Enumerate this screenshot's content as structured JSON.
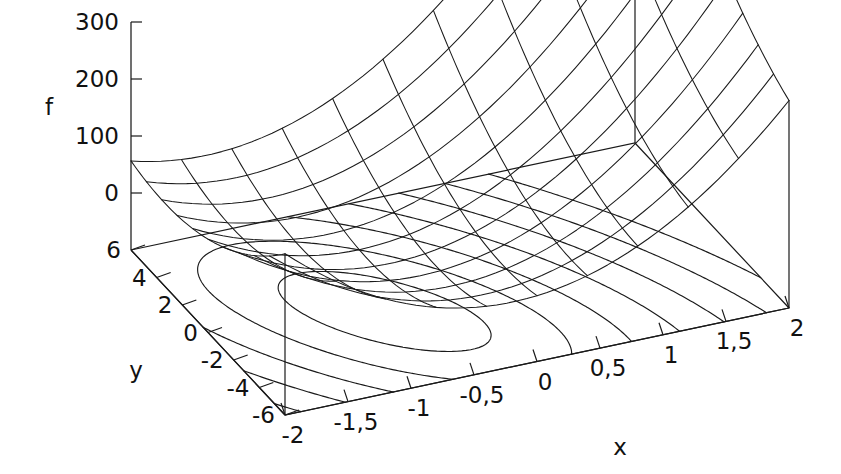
{
  "chart_data": {
    "type": "surface3d",
    "title": "",
    "xlabel": "x",
    "ylabel": "y",
    "zlabel": "f",
    "decimal_separator": ",",
    "projection": {
      "style": "gnuplot-wireframe",
      "base_contours": true,
      "hidden_line_removal": false,
      "rot_x_deg": 60,
      "rot_z_deg": 30
    },
    "x_axis": {
      "label": "x",
      "min": -2,
      "max": 2,
      "tick_step": 0.5,
      "tick_values": [
        -2,
        -1.5,
        -1,
        -0.5,
        0,
        0.5,
        1,
        1.5,
        2
      ],
      "tick_labels": [
        "-2",
        "-1,5",
        "-1",
        "-0,5",
        "0",
        "0,5",
        "1",
        "1,5",
        "2"
      ]
    },
    "y_axis": {
      "label": "y",
      "min": -6,
      "max": 6,
      "tick_step": 2,
      "tick_values": [
        6,
        4,
        2,
        0,
        -2,
        -4,
        -6
      ],
      "tick_labels": [
        "6",
        "4",
        "2",
        "0",
        "-2",
        "-4",
        "-6"
      ]
    },
    "z_axis": {
      "label": "f",
      "min": -100,
      "max": 300,
      "tick_step": 100,
      "tick_values": [
        300,
        200,
        100,
        0
      ],
      "tick_labels": [
        "300",
        "200",
        "100",
        "0"
      ]
    },
    "function": {
      "description": "quadratic bowl with elongated valley; minimum near (x=-0.7, y=-1)",
      "form": "a*(x-x0)^2 + b*(y-y0)^2 + c*(x-x0)*(y-y0) + d",
      "a": 52,
      "b": 1.55,
      "c": 10.5,
      "x0": -0.7,
      "y0": -1.0,
      "d": -12
    },
    "mesh": {
      "x_divisions": 10,
      "y_divisions": 10
    },
    "contours": {
      "count": 7,
      "levels": [
        0,
        25,
        60,
        105,
        160,
        225,
        300
      ]
    },
    "colors": {
      "line": "#1a1a1a",
      "background": "#ffffff"
    }
  }
}
